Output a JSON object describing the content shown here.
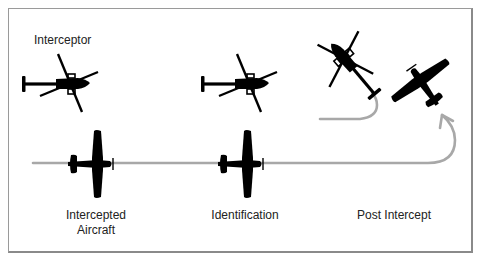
{
  "figure": {
    "type": "intercept-procedure-diagram",
    "labels": {
      "interceptor": "Interceptor",
      "intercepted_line1": "Intercepted",
      "intercepted_line2": "Aircraft",
      "identification": "Identification",
      "post_intercept": "Post Intercept"
    },
    "phases": [
      {
        "name": "Intercepted Aircraft",
        "objects": [
          "helicopter",
          "airplane"
        ]
      },
      {
        "name": "Identification",
        "objects": [
          "helicopter",
          "airplane"
        ]
      },
      {
        "name": "Post Intercept",
        "objects": [
          "helicopter-turning-away",
          "airplane-climbing-turn"
        ]
      }
    ],
    "colors": {
      "silhouette": "#000000",
      "path": "#a8a8a8",
      "border": "#8a8a8a",
      "text": "#222222"
    },
    "icons": {
      "interceptor": "helicopter-icon",
      "intercepted": "airplane-icon",
      "flight_path": "arrow-path-icon"
    }
  }
}
